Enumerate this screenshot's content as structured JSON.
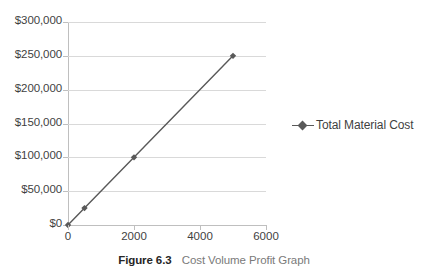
{
  "caption": {
    "figure_number": "Figure 6.3",
    "title": "Cost Volume Profit Graph"
  },
  "legend": {
    "position": "right",
    "entries": [
      {
        "label": "Total Material Cost",
        "color": "#595959",
        "marker": "diamond"
      }
    ]
  },
  "colors": {
    "series": "#595959",
    "gridline": "#d9d9d9",
    "axis": "#bfbfbf",
    "tick_text": "#3f3f3f",
    "caption_number": "#262626",
    "caption_title": "#7a7a7a",
    "background": "#ffffff"
  },
  "chart_data": {
    "type": "line",
    "title": "Cost Volume Profit Graph",
    "xlabel": "",
    "ylabel": "",
    "xlim": [
      0,
      6000
    ],
    "ylim": [
      0,
      300000
    ],
    "grid": true,
    "legend_position": "right",
    "x_ticks": [
      0,
      2000,
      4000,
      6000
    ],
    "x_tick_labels": [
      "0",
      "2000",
      "4000",
      "6000"
    ],
    "y_ticks": [
      0,
      50000,
      100000,
      150000,
      200000,
      250000,
      300000
    ],
    "y_tick_labels": [
      "$0",
      "$50,000",
      "$100,000",
      "$150,000",
      "$200,000",
      "$250,000",
      "$300,000"
    ],
    "series": [
      {
        "name": "Total Material Cost",
        "color": "#595959",
        "marker": "diamond",
        "x": [
          0,
          500,
          2000,
          5000
        ],
        "values": [
          0,
          25000,
          100000,
          250000
        ]
      }
    ]
  }
}
